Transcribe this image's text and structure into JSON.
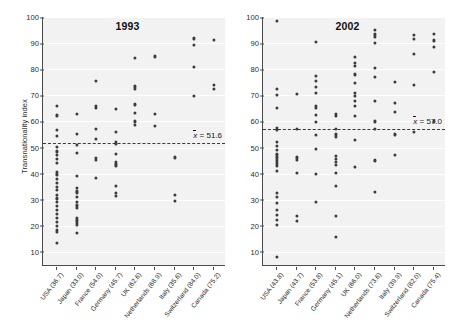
{
  "chart_data": {
    "type": "scatter",
    "title": "",
    "ylabel": "Transnationality index",
    "xlabel": "",
    "ylim": [
      5,
      100
    ],
    "yticks": [
      10,
      20,
      30,
      40,
      50,
      60,
      70,
      80,
      90,
      100
    ],
    "grid": true,
    "legend": null,
    "panels": [
      {
        "title": "1993",
        "mean": 51.6,
        "mean_label": "x̄ = 51.6",
        "categories": [
          "USA (36.7)",
          "Japan (33.0)",
          "France (54.0)",
          "Germany (45.7)",
          "UK (62.6)",
          "Netherlands (68.9)",
          "Italy (35.6)",
          "Switzerland (84.0)",
          "Canada (75.2)"
        ],
        "series": [
          {
            "name": "USA (36.7)",
            "values": [
              66.0,
              62.3,
              56.7,
              54.5,
              50.2,
              48.5,
              47.0,
              45.5,
              44.0,
              40.6,
              40.0,
              39.4,
              38.0,
              36.5,
              35.0,
              33.6,
              32.0,
              30.5,
              29.0,
              27.5,
              26.0,
              24.6,
              23.0,
              21.6,
              20.0,
              18.5,
              17.5,
              13.5
            ]
          },
          {
            "name": "Japan (33.0)",
            "values": [
              63.0,
              55.3,
              51.0,
              47.8,
              39.0,
              34.5,
              33.5,
              32.8,
              31.0,
              29.0,
              27.8,
              27.0,
              23.0,
              22.4,
              21.8,
              21.2,
              20.5,
              17.3
            ]
          },
          {
            "name": "France (54.0)",
            "values": [
              75.5,
              66.0,
              65.3,
              57.0,
              53.3,
              46.0,
              45.3,
              38.2
            ]
          },
          {
            "name": "Germany (45.7)",
            "values": [
              64.7,
              56.0,
              52.0,
              51.5,
              47.7,
              44.5,
              43.5,
              43.0,
              35.2,
              32.6,
              31.3
            ]
          },
          {
            "name": "UK (62.6)",
            "values": [
              84.3,
              73.4,
              72.4,
              66.5,
              63.2,
              60.0,
              58.5
            ]
          },
          {
            "name": "Netherlands (68.9)",
            "values": [
              84.9,
              63.0,
              58.2
            ]
          },
          {
            "name": "Italy (35.6)",
            "values": [
              46.2,
              31.8,
              29.6
            ]
          },
          {
            "name": "Switzerland (84.0)",
            "values": [
              91.8,
              89.4,
              80.9,
              69.7
            ]
          },
          {
            "name": "Canada (75.2)",
            "values": [
              91.1,
              74.0,
              72.5
            ]
          }
        ]
      },
      {
        "title": "2002",
        "mean": 57.0,
        "mean_label": "x̄ = 57.0",
        "categories": [
          "USA (43.8)",
          "Japan (43.7)",
          "France (53.8)",
          "Germany (45.1)",
          "UK (66.0)",
          "Netherlands (73.6)",
          "Italy (39.9)",
          "Switzerland (82.0)",
          "Canada (75.4)"
        ],
        "series": [
          {
            "name": "USA (43.8)",
            "values": [
              98.6,
              72.6,
              70.2,
              65.3,
              57.6,
              56.8,
              52.0,
              50.6,
              49.0,
              47.6,
              47.0,
              46.2,
              45.2,
              44.6,
              43.8,
              43.0,
              41.0,
              32.6,
              31.0,
              28.8,
              26.0,
              24.0,
              22.2,
              20.3,
              8.0
            ]
          },
          {
            "name": "Japan (43.7)",
            "values": [
              70.4,
              57.2,
              46.2,
              45.3,
              40.2,
              23.8,
              21.8
            ]
          },
          {
            "name": "France (53.8)",
            "values": [
              90.6,
              77.4,
              75.4,
              73.2,
              71.0,
              65.8,
              65.0,
              62.4,
              59.8,
              54.8,
              49.4,
              40.0,
              29.3
            ]
          },
          {
            "name": "Germany (45.1)",
            "values": [
              62.8,
              62.0,
              57.0,
              55.0,
              54.0,
              46.8,
              45.6,
              44.6,
              43.4,
              40.2,
              35.4,
              23.8,
              15.7
            ]
          },
          {
            "name": "UK (66.0)",
            "values": [
              84.7,
              82.4,
              81.3,
              78.0,
              74.6,
              71.0,
              69.6,
              68.0,
              65.8,
              62.2,
              52.8,
              42.6
            ]
          },
          {
            "name": "Netherlands (73.6)",
            "values": [
              95.0,
              93.3,
              92.3,
              90.0,
              80.4,
              77.0,
              68.0,
              60.0,
              57.0,
              45.4,
              45.0,
              33.0
            ]
          },
          {
            "name": "Italy (39.9)",
            "values": [
              75.0,
              67.0,
              63.6,
              55.0,
              47.0
            ]
          },
          {
            "name": "Switzerland (82.0)",
            "values": [
              93.0,
              91.6,
              86.0,
              74.0,
              56.0
            ]
          },
          {
            "name": "Canada (75.4)",
            "values": [
              93.4,
              91.0,
              88.4,
              79.0,
              60.0
            ]
          }
        ]
      }
    ]
  }
}
